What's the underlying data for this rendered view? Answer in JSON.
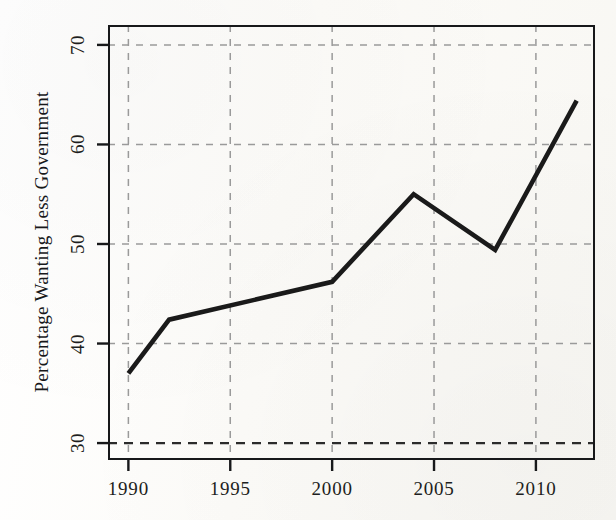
{
  "figure": {
    "background_color": "#fdfdfb",
    "ink_color": "#17181a",
    "gridline_color": "#9a9a9a",
    "series_color": "#1a1a1a"
  },
  "axes": {
    "ylabel": "Percentage Wanting Less Government",
    "xlabel": "",
    "yticks": [
      "30",
      "40",
      "50",
      "60",
      "70"
    ],
    "xticks": [
      "1990",
      "1995",
      "2000",
      "2005",
      "2010"
    ]
  },
  "caption_fragment": "",
  "chart_data": {
    "type": "line",
    "title": "",
    "xlabel": "",
    "ylabel": "Percentage Wanting Less Government",
    "x": [
      1990,
      1992,
      2000,
      2004,
      2008,
      2012
    ],
    "values": [
      37.0,
      42.4,
      46.2,
      55.0,
      49.4,
      64.4
    ],
    "series": [
      {
        "name": "Percentage Wanting Less Government",
        "x": [
          1990,
          1992,
          2000,
          2004,
          2008,
          2012
        ],
        "values": [
          37.0,
          42.4,
          46.2,
          55.0,
          49.4,
          64.4
        ]
      }
    ],
    "xlim": [
      1989.0,
      2012.9
    ],
    "ylim": [
      28.3,
      72.0
    ],
    "xticks": [
      1990,
      1995,
      2000,
      2005,
      2010
    ],
    "yticks": [
      30,
      40,
      50,
      60,
      70
    ],
    "grid": true,
    "grid_style": "dashed",
    "legend": false,
    "legend_position": "none",
    "reference_lines": [
      {
        "orientation": "horizontal",
        "value": 30,
        "style": "dashed",
        "emphasis": "heavy"
      }
    ],
    "annotations": []
  }
}
